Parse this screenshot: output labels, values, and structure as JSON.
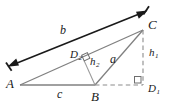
{
  "figure": {
    "type": "geometry-diagram",
    "background_color": "#ffffff",
    "line_color": "#808080",
    "dash_color": "#8c8c8c",
    "arrow_color": "#1a1a1a",
    "text_color": "#1a1a1a"
  },
  "vertices": {
    "a": {
      "label": "A",
      "x": 20,
      "y": 85
    },
    "b": {
      "label": "B",
      "x": 95,
      "y": 85
    },
    "c": {
      "label": "C",
      "x": 143,
      "y": 30
    }
  },
  "feet": {
    "d1": {
      "label": "D",
      "sub": "1",
      "x": 143,
      "y": 85
    },
    "d2": {
      "label": "D",
      "sub": "2",
      "x": 79,
      "y": 55
    }
  },
  "sides": {
    "a": {
      "label": "a",
      "x": 113,
      "y": 60
    },
    "b": {
      "label": "b",
      "x": 64,
      "y": 31
    },
    "c": {
      "label": "c",
      "x": 60,
      "y": 92
    }
  },
  "altitudes": {
    "h1": {
      "label": "h",
      "sub": "1",
      "x": 152,
      "y": 53
    },
    "h2": {
      "label": "h",
      "sub": "2",
      "x": 94,
      "y": 62
    }
  },
  "right_angles": [
    {
      "name": "right-angle-d2",
      "x": 88,
      "y": 57
    },
    {
      "name": "right-angle-d1",
      "x": 135,
      "y": 78
    }
  ],
  "dimension_arrow": {
    "name": "b-dimension-arrow",
    "from_x": 9,
    "from_y": 66,
    "to_x": 146,
    "to_y": 11,
    "double_headed": true
  }
}
